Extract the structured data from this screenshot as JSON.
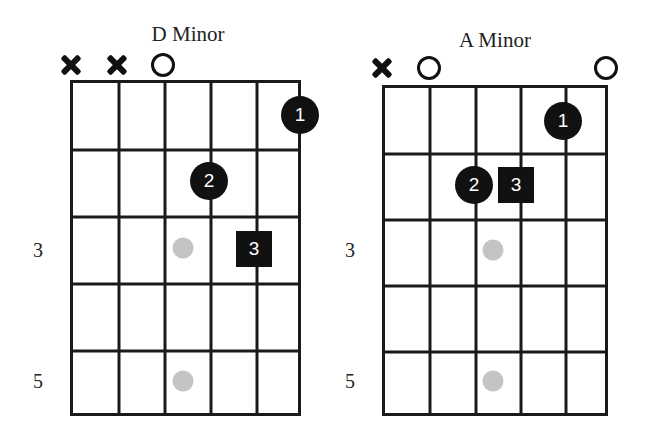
{
  "diagram": {
    "type": "guitar-chord-charts",
    "chords": [
      {
        "name": "D Minor",
        "title_pos": [
          188,
          22
        ],
        "grid": {
          "left": 71,
          "top": 81,
          "width": 231,
          "height": 336
        },
        "strings_x": [
          71,
          117,
          163,
          209,
          255,
          300
        ],
        "frets_y": [
          81,
          148,
          215,
          282,
          349,
          415
        ],
        "string_markers": [
          {
            "type": "mute",
            "x": 71,
            "y": 65
          },
          {
            "type": "mute",
            "x": 117,
            "y": 65
          },
          {
            "type": "open",
            "x": 163,
            "y": 65
          }
        ],
        "fingers": [
          {
            "label": "1",
            "shape": "circle",
            "x": 300,
            "y": 115,
            "string": 6,
            "fret": 1
          },
          {
            "label": "2",
            "shape": "circle",
            "x": 209,
            "y": 181,
            "string": 4,
            "fret": 2
          },
          {
            "label": "3",
            "shape": "square",
            "x": 254,
            "y": 249,
            "string": 5,
            "fret": 3
          }
        ],
        "inlays": [
          {
            "x": 183,
            "y": 248
          },
          {
            "x": 183,
            "y": 381
          }
        ],
        "fret_numbers": [
          {
            "label": "3",
            "x": 38,
            "y": 250
          },
          {
            "label": "5",
            "x": 38,
            "y": 381
          }
        ]
      },
      {
        "name": "A Minor",
        "title_pos": [
          495,
          28
        ],
        "grid": {
          "left": 383,
          "top": 86,
          "width": 226,
          "height": 331
        },
        "strings_x": [
          383,
          428,
          474,
          519,
          564,
          606
        ],
        "frets_y": [
          86,
          152,
          218,
          284,
          350,
          414
        ],
        "string_markers": [
          {
            "type": "mute",
            "x": 382,
            "y": 68
          },
          {
            "type": "open",
            "x": 429,
            "y": 68
          },
          {
            "type": "open",
            "x": 606,
            "y": 68
          }
        ],
        "fingers": [
          {
            "label": "1",
            "shape": "circle",
            "x": 563,
            "y": 121,
            "string": 5,
            "fret": 1
          },
          {
            "label": "2",
            "shape": "circle",
            "x": 474,
            "y": 185,
            "string": 3,
            "fret": 2
          },
          {
            "label": "3",
            "shape": "square",
            "x": 516,
            "y": 185,
            "string": 4,
            "fret": 2
          }
        ],
        "inlays": [
          {
            "x": 493,
            "y": 250
          },
          {
            "x": 493,
            "y": 381
          }
        ],
        "fret_numbers": [
          {
            "label": "3",
            "x": 350,
            "y": 250
          },
          {
            "label": "5",
            "x": 350,
            "y": 381
          }
        ]
      }
    ]
  },
  "labels": {
    "chord_0_title": "D Minor",
    "chord_1_title": "A Minor"
  },
  "colors": {
    "ink": "#111111",
    "inlay": "#c4c4c4",
    "background": "#ffffff"
  }
}
